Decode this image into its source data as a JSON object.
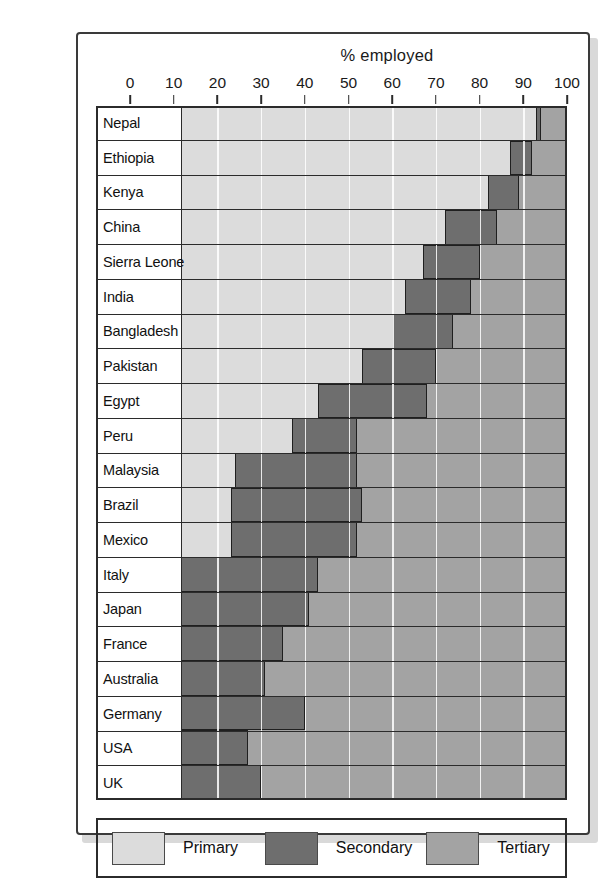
{
  "chart_data": {
    "type": "bar",
    "orientation": "horizontal",
    "stacked": true,
    "title": "% employed",
    "xlabel": "",
    "ylabel": "",
    "xlim": [
      0,
      100
    ],
    "xticks": [
      0,
      10,
      20,
      30,
      40,
      50,
      60,
      70,
      80,
      90,
      100
    ],
    "grid": true,
    "legend_position": "bottom",
    "categories": [
      "Nepal",
      "Ethiopia",
      "Kenya",
      "China",
      "Sierra Leone",
      "India",
      "Bangladesh",
      "Pakistan",
      "Egypt",
      "Peru",
      "Malaysia",
      "Brazil",
      "Mexico",
      "Italy",
      "Japan",
      "France",
      "Australia",
      "Germany",
      "USA",
      "UK"
    ],
    "series": [
      {
        "name": "Primary",
        "color": "#dcdcdc",
        "values": [
          93,
          87,
          82,
          72,
          67,
          63,
          60,
          53,
          43,
          37,
          24,
          23,
          23,
          9,
          7,
          5,
          4,
          4,
          3,
          2
        ]
      },
      {
        "name": "Secondary",
        "color": "#6e6e6e",
        "values": [
          1,
          5,
          7,
          12,
          13,
          15,
          14,
          17,
          25,
          15,
          28,
          30,
          29,
          34,
          34,
          30,
          27,
          36,
          24,
          28
        ]
      },
      {
        "name": "Tertiary",
        "color": "#a3a3a3",
        "values": [
          6,
          8,
          11,
          16,
          20,
          22,
          26,
          30,
          32,
          48,
          48,
          47,
          48,
          57,
          59,
          65,
          69,
          60,
          73,
          70
        ]
      }
    ]
  },
  "axis": {
    "tick_labels": [
      "0",
      "10",
      "20",
      "30",
      "40",
      "50",
      "60",
      "70",
      "80",
      "90",
      "100"
    ]
  },
  "legend": {
    "items": [
      {
        "label": "Primary",
        "swatch": "primary"
      },
      {
        "label": "Secondary",
        "swatch": "secondary"
      },
      {
        "label": "Tertiary",
        "swatch": "tertiary"
      }
    ]
  }
}
